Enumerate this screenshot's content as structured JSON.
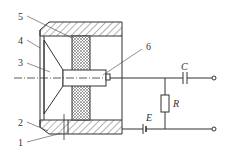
{
  "diagram": {
    "type": "sensor cross-section with circuit",
    "part_labels": [
      "1",
      "2",
      "3",
      "4",
      "5",
      "6"
    ],
    "circuit_labels": {
      "capacitor": "C",
      "resistor": "R",
      "source": "E"
    },
    "colors": {
      "line": "#333333",
      "background": "#ffffff"
    }
  }
}
